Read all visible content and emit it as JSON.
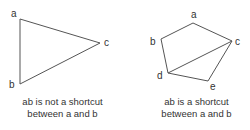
{
  "diagrams": [
    {
      "id": "left",
      "vertices": {
        "a": {
          "label": "a",
          "x": 20,
          "y": 19
        },
        "b": {
          "label": "b",
          "x": 20,
          "y": 84
        },
        "c": {
          "label": "c",
          "x": 100,
          "y": 43
        }
      },
      "edges": [
        [
          "a",
          "b"
        ],
        [
          "a",
          "c"
        ],
        [
          "b",
          "c"
        ]
      ],
      "caption": {
        "line1": "ab is not a shortcut",
        "line2": "between a and b"
      }
    },
    {
      "id": "right",
      "vertices": {
        "a": {
          "label": "a",
          "x": 193,
          "y": 23
        },
        "b": {
          "label": "b",
          "x": 161,
          "y": 39
        },
        "c": {
          "label": "c",
          "x": 232,
          "y": 41
        },
        "d": {
          "label": "d",
          "x": 168,
          "y": 73
        },
        "e": {
          "label": "e",
          "x": 208,
          "y": 81
        }
      },
      "edges": [
        [
          "a",
          "b"
        ],
        [
          "a",
          "c"
        ],
        [
          "b",
          "d"
        ],
        [
          "d",
          "c"
        ],
        [
          "d",
          "e"
        ],
        [
          "e",
          "c"
        ]
      ],
      "caption": {
        "line1": "ab is a shortcut",
        "line2": "between a and b"
      }
    }
  ],
  "colors": {
    "edge": "#555555",
    "text": "#333333",
    "background": "#ffffff"
  }
}
